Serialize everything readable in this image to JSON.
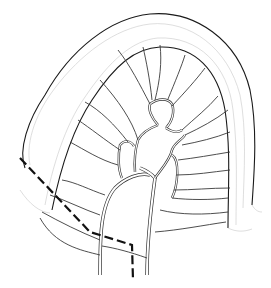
{
  "figure": {
    "elements": [
      "bowel-wall",
      "mesentery-border",
      "mesenteric-vessels",
      "vascular-arcades",
      "resection-line"
    ],
    "colors": {
      "background": "#ffffff",
      "line": "#1a1a1a",
      "shading": "#c8c8c8",
      "resection_line": "#111111"
    }
  }
}
